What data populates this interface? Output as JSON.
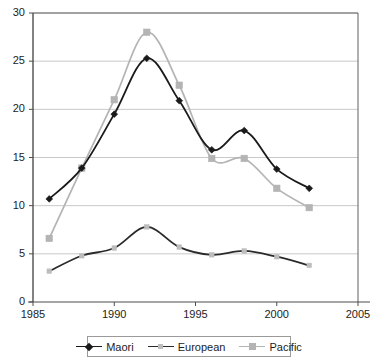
{
  "chart_data": {
    "type": "line",
    "title": "",
    "xlabel": "",
    "ylabel": "",
    "xlim": [
      1985,
      2005
    ],
    "ylim": [
      0,
      30
    ],
    "xticks": [
      1985,
      1990,
      1995,
      2000,
      2005
    ],
    "yticks": [
      0,
      5,
      10,
      15,
      20,
      25,
      30
    ],
    "grid": "horizontal",
    "legend_position": "bottom",
    "x": [
      1986,
      1988,
      1990,
      1992,
      1994,
      1996,
      1998,
      2000,
      2002
    ],
    "series": [
      {
        "name": "Maori",
        "color": "#1a1a1a",
        "marker": "diamond",
        "values": [
          10.7,
          13.9,
          19.5,
          25.3,
          20.9,
          15.8,
          17.8,
          13.8,
          11.8
        ]
      },
      {
        "name": "European",
        "color": "#2b2b2b",
        "marker": "small-square",
        "values": [
          3.2,
          4.8,
          5.6,
          7.8,
          5.7,
          4.9,
          5.3,
          4.7,
          3.8
        ]
      },
      {
        "name": "Pacific",
        "color": "#b4b4b4",
        "marker": "square",
        "values": [
          6.6,
          13.9,
          21.0,
          28.0,
          22.5,
          14.9,
          14.9,
          11.8,
          9.8
        ]
      }
    ]
  },
  "axis": {
    "y_tick_labels": [
      "30",
      "25",
      "20",
      "15",
      "10",
      "5",
      "0"
    ],
    "x_tick_labels": [
      "1985",
      "1990",
      "1995",
      "2000",
      "2005"
    ]
  },
  "legend": {
    "items": [
      {
        "label": "Maori"
      },
      {
        "label": "European"
      },
      {
        "label": "Pacific"
      }
    ]
  },
  "colors": {
    "maori": "#1a1a1a",
    "european": "#2b2b2b",
    "pacific": "#b4b4b4",
    "grid": "#c8c8c8",
    "axis": "#606060",
    "text": "#1c1c1c"
  }
}
